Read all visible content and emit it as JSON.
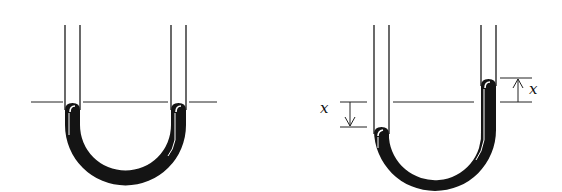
{
  "figure": {
    "colors": {
      "ink": "#111111",
      "liquid": "#141414",
      "highlight": "#ffffff",
      "background": "#ffffff"
    },
    "panels": [
      {
        "id": "equilibrium",
        "label": "",
        "left_level_y": 102,
        "right_level_y": 102
      },
      {
        "id": "displaced",
        "label": "",
        "left_level_y": 127,
        "right_level_y": 79,
        "annotations": [
          {
            "text": "x",
            "side": "left",
            "direction": "down"
          },
          {
            "text": "x",
            "side": "right",
            "direction": "up"
          }
        ]
      }
    ]
  }
}
